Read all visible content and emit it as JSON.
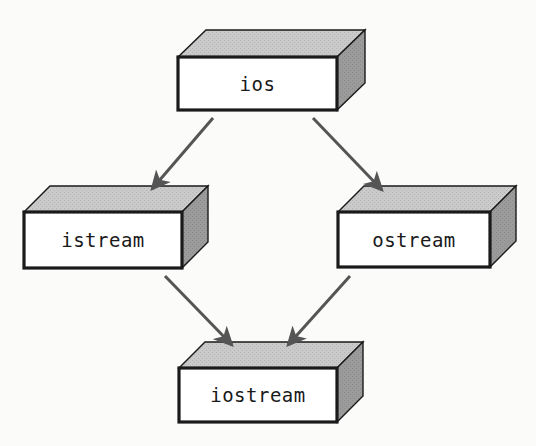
{
  "diagram": {
    "type": "inheritance-diagram",
    "background_color": "#fbfbfa",
    "box_face_color": "#ffffff",
    "box_top_color": "#c9c9c9",
    "box_side_color": "#9a9a9a",
    "box_outline_color": "#1a1a1a",
    "arrow_color": "#555555",
    "nodes": [
      {
        "id": "ios",
        "label": "ios",
        "x": 178,
        "y": 57,
        "w": 159,
        "h": 53,
        "dx": 28,
        "dy": -27
      },
      {
        "id": "istream",
        "label": "istream",
        "x": 24,
        "y": 212,
        "w": 158,
        "h": 56,
        "dx": 26,
        "dy": -26
      },
      {
        "id": "ostream",
        "label": "ostream",
        "x": 338,
        "y": 212,
        "w": 152,
        "h": 55,
        "dx": 26,
        "dy": -26
      },
      {
        "id": "iostream",
        "label": "iostream",
        "x": 179,
        "y": 368,
        "w": 158,
        "h": 54,
        "dx": 26,
        "dy": -26
      }
    ],
    "edges": [
      {
        "id": "ios-to-istream",
        "from": "ios",
        "to": "istream",
        "x1": 213,
        "y1": 118,
        "x2": 152,
        "y2": 189
      },
      {
        "id": "ios-to-ostream",
        "from": "ios",
        "to": "ostream",
        "x1": 313,
        "y1": 118,
        "x2": 382,
        "y2": 190
      },
      {
        "id": "istream-to-iostream",
        "from": "istream",
        "to": "iostream",
        "x1": 165,
        "y1": 276,
        "x2": 232,
        "y2": 345
      },
      {
        "id": "ostream-to-iostream",
        "from": "ostream",
        "to": "iostream",
        "x1": 350,
        "y1": 276,
        "x2": 288,
        "y2": 345
      }
    ]
  }
}
